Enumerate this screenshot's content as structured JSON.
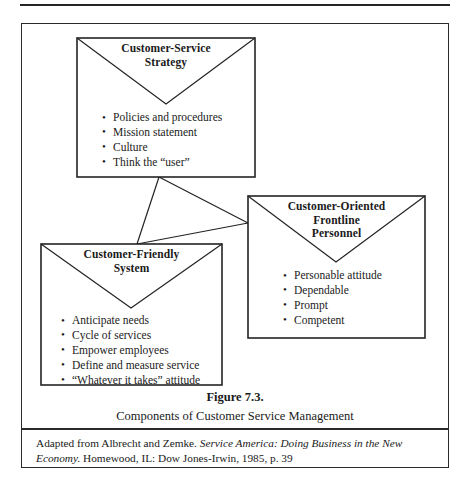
{
  "figure": {
    "caption_title": "Figure 7.3.",
    "caption_subtitle": "Components of Customer Service Management",
    "source_prefix": "Adapted from Albrecht and Zemke. ",
    "source_italic_1": "Service America: Doing Business in the New Economy.",
    "source_suffix": " Homewood, IL: Dow Jones-Irwin, 1985, p. 39"
  },
  "boxes": [
    {
      "id": "customer-service-strategy",
      "title": "Customer-Service\nStrategy",
      "title_line_1": "Customer-Service",
      "title_line_2": "Strategy",
      "bullets": [
        "Policies and procedures",
        "Mission statement",
        "Culture",
        "Think the “user”"
      ]
    },
    {
      "id": "customer-oriented-frontline-personnel",
      "title": "Customer-Oriented\nFrontline\nPersonnel",
      "title_line_1": "Customer-Oriented",
      "title_line_2": "Frontline",
      "title_line_3": "Personnel",
      "bullets": [
        "Personable attitude",
        "Dependable",
        "Prompt",
        "Competent"
      ]
    },
    {
      "id": "customer-friendly-system",
      "title": "Customer-Friendly\nSystem",
      "title_line_1": "Customer-Friendly",
      "title_line_2": "System",
      "bullets": [
        "Anticipate needs",
        "Cycle of services",
        "Empower employees",
        "Define and measure service",
        "“Whatever it takes” attitude"
      ]
    }
  ],
  "style": {
    "line_color": "#232323",
    "page_background": "#ffffff",
    "text_color": "#1a1a1a"
  }
}
